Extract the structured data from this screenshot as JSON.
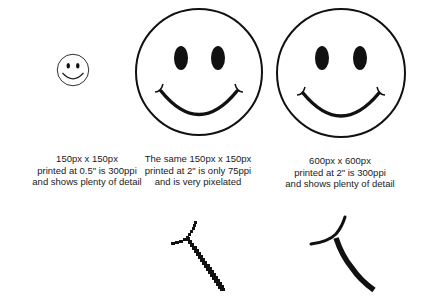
{
  "figures": [
    {
      "id": "small",
      "caption": [
        "150px x 150px",
        "printed at 0.5\" is 300ppi",
        "and shows plenty of detail"
      ]
    },
    {
      "id": "pixelated",
      "caption": [
        "The same 150px x 150px",
        "printed at 2\" is only 75ppi",
        "and is very pixelated"
      ]
    },
    {
      "id": "large",
      "caption": [
        "600px x 600px",
        "printed at 2\" is 300ppi",
        "and shows plenty of detail"
      ]
    }
  ],
  "colors": {
    "stroke": "#111111",
    "background": "#ffffff",
    "text": "#1a1a1a"
  }
}
